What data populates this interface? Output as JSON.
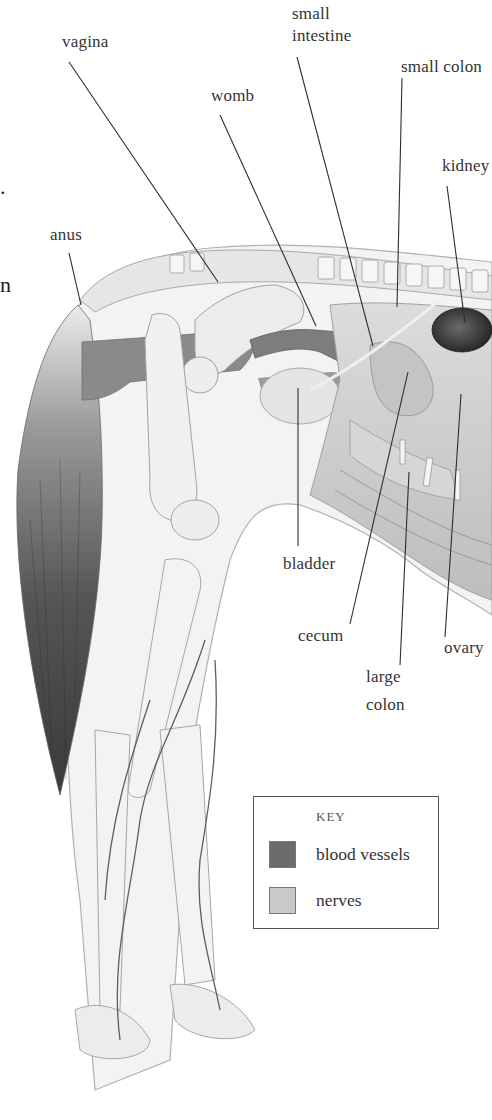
{
  "diagram": {
    "labels": [
      {
        "id": "vagina",
        "text": "vagina",
        "x": 62,
        "y": 31,
        "line": [
          69,
          62,
          218,
          282
        ]
      },
      {
        "id": "small-intestine-1",
        "text": "small",
        "x": 292,
        "y": 3
      },
      {
        "id": "small-intestine-2",
        "text": "intestine",
        "x": 292,
        "y": 25,
        "line": [
          297,
          57,
          373,
          346
        ]
      },
      {
        "id": "small-colon",
        "text": "small colon",
        "x": 401,
        "y": 56,
        "line": [
          402,
          78,
          397,
          307
        ]
      },
      {
        "id": "womb",
        "text": "womb",
        "x": 211,
        "y": 85,
        "line": [
          220,
          115,
          316,
          326
        ]
      },
      {
        "id": "kidney",
        "text": "kidney",
        "x": 442,
        "y": 155,
        "line": [
          447,
          186,
          465,
          323
        ]
      },
      {
        "id": "anus",
        "text": "anus",
        "x": 50,
        "y": 224,
        "line": [
          69,
          253,
          81,
          305
        ]
      },
      {
        "id": "bladder",
        "text": "bladder",
        "x": 283,
        "y": 553,
        "line": [
          298,
          388,
          298,
          546
        ]
      },
      {
        "id": "cecum",
        "text": "cecum",
        "x": 298,
        "y": 625,
        "line": [
          408,
          372,
          350,
          624
        ]
      },
      {
        "id": "ovary",
        "text": "ovary",
        "x": 444,
        "y": 637,
        "line": [
          461,
          394,
          445,
          637
        ]
      },
      {
        "id": "large-colon-1",
        "text": "large",
        "x": 366,
        "y": 666,
        "line": [
          409,
          472,
          400,
          665
        ]
      },
      {
        "id": "large-colon-2",
        "text": "colon",
        "x": 366,
        "y": 694
      }
    ],
    "edge_fragments": [
      {
        "text": ".",
        "x": 0,
        "y": 174
      },
      {
        "text": "n",
        "x": 0,
        "y": 272
      }
    ]
  },
  "key": {
    "title": "KEY",
    "items": [
      {
        "label": "blood vessels",
        "color": "#6b6b6b"
      },
      {
        "label": "nerves",
        "color": "#c9c9c9"
      }
    ]
  },
  "colors": {
    "background": "#ffffff",
    "leader_line": "#2e2e2e",
    "body_outline": "#a8a8a8",
    "body_fill": "#f2f2f2",
    "bone": "#e9e9e9",
    "organ_mid": "#cfcfcf",
    "organ_dark": "#8f8f8f",
    "kidney": "#3e3e3e",
    "tail_dark": "#3a3a3a",
    "blood_vessel": "#5e5e5e",
    "nerve": "#e2e2e2"
  }
}
